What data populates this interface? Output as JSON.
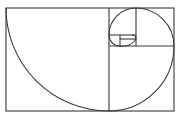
{
  "diagram": {
    "stroke_color": "#3a3a3a",
    "background": "#ffffff",
    "outer_rect": {
      "x": 6,
      "y": 8,
      "w": 168,
      "h": 103
    },
    "squares": [
      {
        "x": 6,
        "y": 8,
        "size": 103
      },
      {
        "x": 109,
        "y": 46,
        "size": 65
      },
      {
        "x": 136,
        "y": 8,
        "size": 38
      },
      {
        "x": 109,
        "y": 8,
        "size": 27
      },
      {
        "x": 109,
        "y": 35,
        "size": 11
      },
      {
        "x": 120,
        "y": 35,
        "size": 16
      }
    ]
  }
}
